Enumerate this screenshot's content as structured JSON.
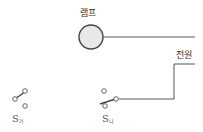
{
  "diagram": {
    "type": "circuit",
    "lamp": {
      "label": "램프",
      "fill": "#e8e8e8",
      "stroke": "#444444"
    },
    "power": {
      "label": "전원"
    },
    "switches": [
      {
        "id": "s1",
        "symbol": "S",
        "subscript": "가"
      },
      {
        "id": "s2",
        "symbol": "S",
        "subscript": "나"
      }
    ],
    "wire_color": "#555555"
  }
}
